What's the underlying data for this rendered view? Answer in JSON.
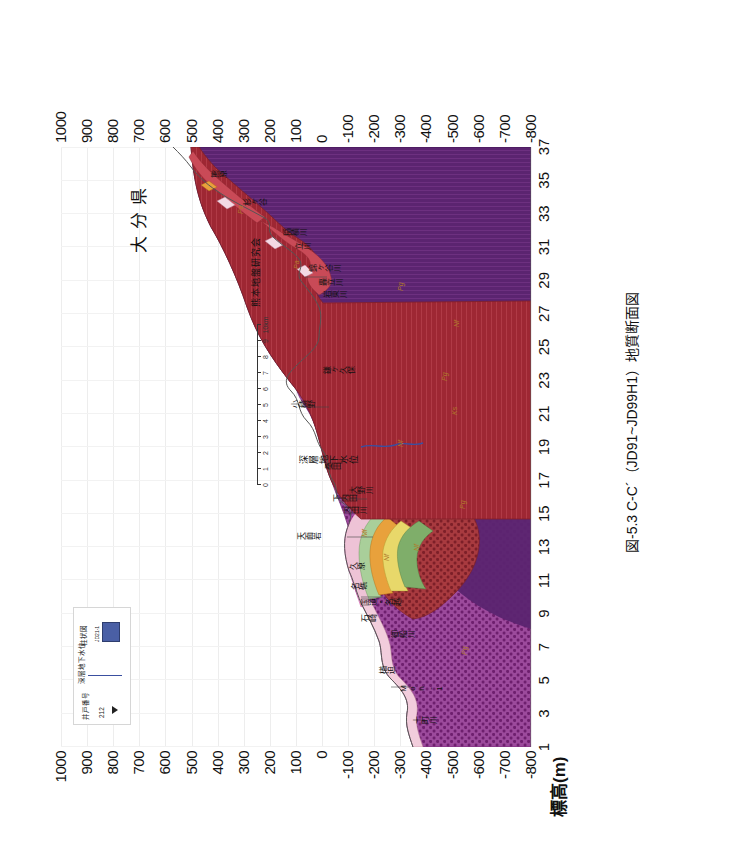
{
  "figure": {
    "caption": "図-5.3  C-C´（JD91~JD99H1）地質断面図",
    "credit": "熊本地盤研究会",
    "prefecture_label": "大分県",
    "groundwater_label": "深層地下水位"
  },
  "axes": {
    "y_title": "標高(m)",
    "y_ticks": [
      "1000",
      "900",
      "800",
      "700",
      "600",
      "500",
      "400",
      "300",
      "200",
      "100",
      "0",
      "-100",
      "-200",
      "-300",
      "-400",
      "-500",
      "-600",
      "-700",
      "-800"
    ],
    "x_ticks": [
      "1",
      "3",
      "5",
      "7",
      "9",
      "11",
      "13",
      "15",
      "17",
      "19",
      "21",
      "23",
      "25",
      "27",
      "29",
      "31",
      "33",
      "35",
      "37"
    ]
  },
  "scale_bar": {
    "ticks": [
      "0",
      "1",
      "2",
      "3",
      "4",
      "5",
      "6",
      "7",
      "8",
      "9",
      "10km"
    ]
  },
  "legend": {
    "well_number_label": "井戸番号",
    "well_number_value": "212",
    "groundwater_label": "深層地下水位",
    "column_label": "柱状図",
    "column_code": "JD21-1"
  },
  "place_names": [
    {
      "text": "十町川",
      "x": 22,
      "y": 352
    },
    {
      "text": "Mon-1",
      "x": 54,
      "y": 338
    },
    {
      "text": "楢迫",
      "x": 72,
      "y": 318
    },
    {
      "text": "御船川",
      "x": 108,
      "y": 330
    },
    {
      "text": "石崎",
      "x": 124,
      "y": 300
    },
    {
      "text": "国道・名越",
      "x": 140,
      "y": 300
    },
    {
      "text": "名礁",
      "x": 156,
      "y": 290
    },
    {
      "text": "久原",
      "x": 176,
      "y": 288
    },
    {
      "text": "天面岩",
      "x": 206,
      "y": 236
    },
    {
      "text": "内田川",
      "x": 232,
      "y": 282
    },
    {
      "text": "下内田",
      "x": 244,
      "y": 272
    },
    {
      "text": "大野川",
      "x": 252,
      "y": 288
    },
    {
      "text": "桑田",
      "x": 276,
      "y": 264
    },
    {
      "text": "小積野",
      "x": 338,
      "y": 230
    },
    {
      "text": "鎌ヶ久保",
      "x": 372,
      "y": 262
    },
    {
      "text": "岩東川",
      "x": 448,
      "y": 262
    },
    {
      "text": "轟立川",
      "x": 460,
      "y": 258
    },
    {
      "text": "錦ヶ谷川",
      "x": 474,
      "y": 248
    },
    {
      "text": "立川",
      "x": 496,
      "y": 234
    },
    {
      "text": "稲積川",
      "x": 510,
      "y": 222
    },
    {
      "text": "杉ヶ谷",
      "x": 540,
      "y": 182
    },
    {
      "text": "熊原",
      "x": 568,
      "y": 150
    }
  ],
  "unit_labels": [
    {
      "text": "Pg",
      "x": 92,
      "y": 400
    },
    {
      "text": "Pg",
      "x": 238,
      "y": 398
    },
    {
      "text": "Nf",
      "x": 196,
      "y": 352
    },
    {
      "text": "Nf",
      "x": 186,
      "y": 322
    },
    {
      "text": "Nf",
      "x": 300,
      "y": 336
    },
    {
      "text": "Nf",
      "x": 420,
      "y": 392
    },
    {
      "text": "Pg",
      "x": 456,
      "y": 336
    },
    {
      "text": "Pg",
      "x": 366,
      "y": 380
    },
    {
      "text": "Pa",
      "x": 478,
      "y": 232
    },
    {
      "text": "Pa",
      "x": 533,
      "y": 176
    },
    {
      "text": "Mf",
      "x": 210,
      "y": 300
    },
    {
      "text": "Ks",
      "x": 332,
      "y": 390
    }
  ],
  "colors": {
    "deep_purple": "#5b2470",
    "mid_purple": "#7b2f86",
    "dotted_purple": "#8e3c8c",
    "dark_red": "#9e2733",
    "brick_red": "#a83a3f",
    "rose": "#c94a57",
    "pink": "#eec3d6",
    "light_pink": "#f4d9e4",
    "green": "#7fae6a",
    "light_green": "#a9cf9a",
    "orange": "#e8a13c",
    "yellow": "#e8d86a",
    "pale": "#f6f2e8",
    "outline": "#4a4a4a",
    "gw_blue": "#3a4fa0",
    "legend_swatch": "#4a5fa5"
  }
}
